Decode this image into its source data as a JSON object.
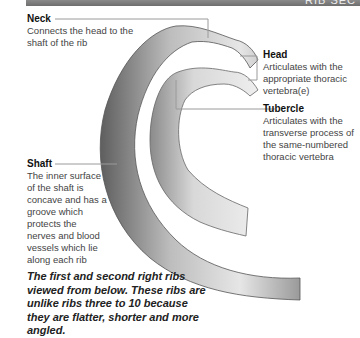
{
  "header": {
    "title_fragment": "RIB SEC"
  },
  "labels": {
    "neck": {
      "title": "Neck",
      "text": "Connects the head to the shaft of the rib"
    },
    "head": {
      "title": "Head",
      "text": "Articulates with the appropriate thoracic vertebra(e)"
    },
    "tubercle": {
      "title": "Tubercle",
      "text": "Articulates with the transverse process of the same-numbered thoracic vertebra"
    },
    "shaft": {
      "title": "Shaft",
      "text": "The inner surface of the shaft is concave and has a groove which protects the nerves and blood vessels which lie along each rib"
    }
  },
  "caption": "The first and second right ribs viewed from below. These ribs are unlike ribs three to 10 because they are flatter, shorter and more angled.",
  "colors": {
    "bar": "#7a7a7a",
    "leader": "#9a9a9a",
    "bone_dark": "#6a6a6a",
    "bone_light": "#e4e4e4"
  }
}
